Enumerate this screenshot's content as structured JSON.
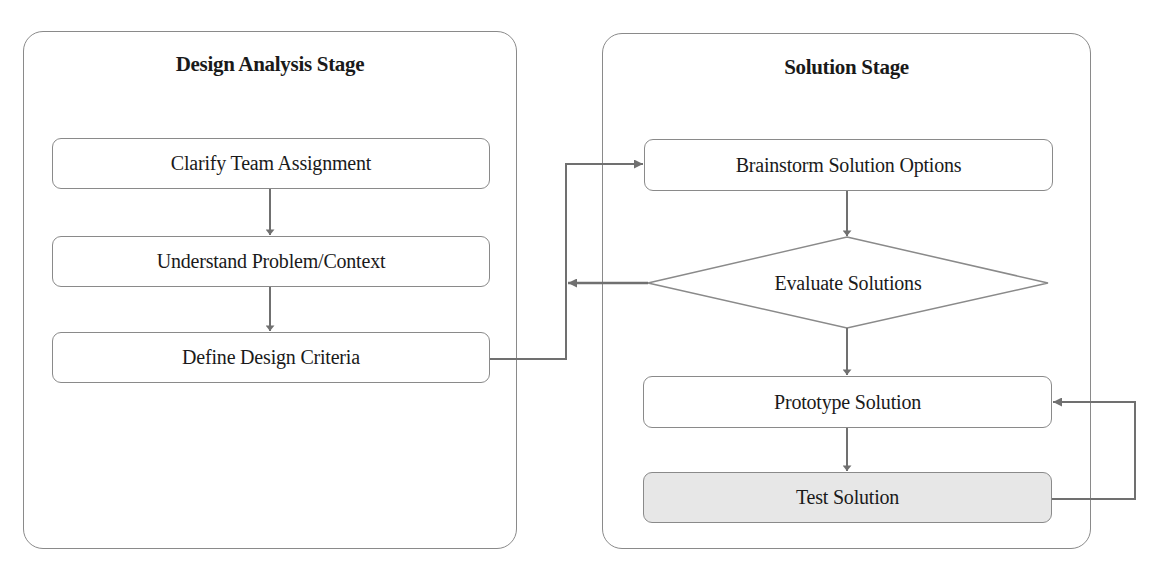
{
  "panels": {
    "analysis": {
      "title": "Design Analysis Stage"
    },
    "solution": {
      "title": "Solution Stage"
    }
  },
  "nodes": {
    "clarify": {
      "label": "Clarify Team Assignment",
      "shape": "rounded-rect"
    },
    "understand": {
      "label": "Understand Problem/Context",
      "shape": "rounded-rect"
    },
    "define": {
      "label": "Define Design Criteria",
      "shape": "rounded-rect"
    },
    "brainstorm": {
      "label": "Brainstorm Solution Options",
      "shape": "rounded-rect"
    },
    "evaluate": {
      "label": "Evaluate Solutions",
      "shape": "diamond"
    },
    "prototype": {
      "label": "Prototype Solution",
      "shape": "rounded-rect"
    },
    "test": {
      "label": "Test Solution",
      "shape": "rounded-rect",
      "fill": "#e7e7e7"
    }
  },
  "edges": [
    {
      "from": "clarify",
      "to": "understand"
    },
    {
      "from": "understand",
      "to": "define"
    },
    {
      "from": "define",
      "to": "brainstorm"
    },
    {
      "from": "brainstorm",
      "to": "evaluate"
    },
    {
      "from": "evaluate",
      "to": "define-brainstorm-connector"
    },
    {
      "from": "evaluate",
      "to": "prototype"
    },
    {
      "from": "prototype",
      "to": "test"
    },
    {
      "from": "test",
      "to": "prototype"
    }
  ],
  "colors": {
    "border": "#8a8a8a",
    "arrow": "#707070",
    "text": "#1a1a1a",
    "shaded_fill": "#e7e7e7"
  }
}
